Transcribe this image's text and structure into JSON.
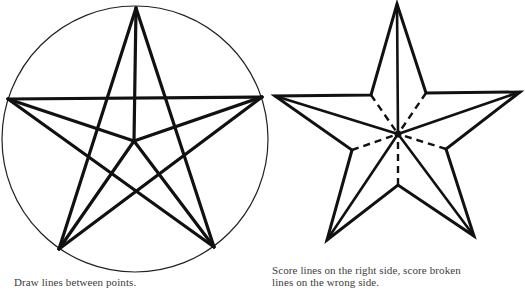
{
  "figures": [
    {
      "id": "pentagram-in-circle",
      "caption": "Draw lines between points.",
      "circle": {
        "cx": 135,
        "cy": 139,
        "r": 133,
        "stroke": "#222222",
        "stroke_width": 1.2
      },
      "points": {
        "top": [
          136,
          8
        ],
        "left": [
          8,
          99
        ],
        "right": [
          262,
          97
        ],
        "bottom_left": [
          59,
          249
        ],
        "bottom_right": [
          214,
          247
        ],
        "center": [
          134,
          141
        ]
      },
      "solid_lines": [
        [
          "top",
          "bottom_left"
        ],
        [
          "top",
          "bottom_right"
        ],
        [
          "left",
          "right"
        ],
        [
          "left",
          "bottom_right"
        ],
        [
          "right",
          "bottom_left"
        ],
        [
          "top",
          "center"
        ],
        [
          "left",
          "center"
        ],
        [
          "right",
          "center"
        ],
        [
          "bottom_left",
          "center"
        ],
        [
          "bottom_right",
          "center"
        ]
      ],
      "line_color": "#111111",
      "line_width": 3.2
    },
    {
      "id": "scored-star",
      "caption_line1": "Score lines on the right side, score broken",
      "caption_line2": "lines on the wrong side.",
      "points": {
        "top": [
          397,
          4
        ],
        "inner_upper_right": [
          426,
          93
        ],
        "right": [
          520,
          92
        ],
        "inner_lower_right": [
          446,
          149
        ],
        "bottom_right": [
          474,
          236
        ],
        "inner_bottom": [
          398,
          185
        ],
        "bottom_left": [
          327,
          240
        ],
        "inner_lower_left": [
          352,
          150
        ],
        "left": [
          275,
          96
        ],
        "inner_upper_left": [
          371,
          95
        ],
        "center": [
          398,
          134
        ]
      },
      "outline_order": [
        "top",
        "inner_upper_right",
        "right",
        "inner_lower_right",
        "bottom_right",
        "inner_bottom",
        "bottom_left",
        "inner_lower_left",
        "left",
        "inner_upper_left"
      ],
      "solid_score_lines": [
        [
          "top",
          "center"
        ],
        [
          "right",
          "center"
        ],
        [
          "bottom_right",
          "center"
        ],
        [
          "bottom_left",
          "center"
        ],
        [
          "left",
          "center"
        ]
      ],
      "dashed_score_lines": [
        [
          "inner_upper_right",
          "center"
        ],
        [
          "inner_lower_right",
          "center"
        ],
        [
          "inner_bottom",
          "center"
        ],
        [
          "inner_lower_left",
          "center"
        ],
        [
          "inner_upper_left",
          "center"
        ]
      ],
      "line_color": "#111111",
      "line_width": 3,
      "dash_pattern": "7 5"
    }
  ]
}
